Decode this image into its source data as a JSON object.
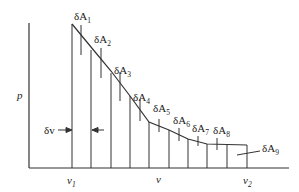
{
  "diagram": {
    "axes": {
      "y_label": "p",
      "x_labels": {
        "v1": "v",
        "v1_sub": "1",
        "v": "v",
        "v2": "v",
        "v2_sub": "2"
      }
    },
    "delta_v_label": "δv",
    "strips": [
      {
        "label": "δA",
        "sub": "1"
      },
      {
        "label": "δA",
        "sub": "2"
      },
      {
        "label": "δA",
        "sub": "3"
      },
      {
        "label": "δA",
        "sub": "4"
      },
      {
        "label": "δA",
        "sub": "5"
      },
      {
        "label": "δA",
        "sub": "6"
      },
      {
        "label": "δA",
        "sub": "7"
      },
      {
        "label": "δA",
        "sub": "8"
      },
      {
        "label": "δA",
        "sub": "9"
      }
    ]
  }
}
